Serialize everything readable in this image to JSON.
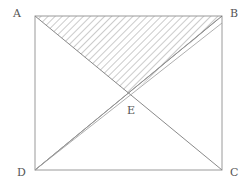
{
  "diagram": {
    "type": "geometry",
    "shape": "rectangle ABCD with diagonals",
    "points": {
      "A": {
        "label": "A",
        "x": 35,
        "y": 16
      },
      "B": {
        "label": "B",
        "x": 222,
        "y": 16
      },
      "C": {
        "label": "C",
        "x": 222,
        "y": 170
      },
      "D": {
        "label": "D",
        "x": 35,
        "y": 170
      },
      "E": {
        "label": "E",
        "x": 130,
        "y": 95
      }
    },
    "label_positions": {
      "A": {
        "left": 13,
        "top": 8
      },
      "B": {
        "left": 230,
        "top": 8
      },
      "C": {
        "left": 230,
        "top": 167
      },
      "D": {
        "left": 17,
        "top": 167
      },
      "E": {
        "left": 127,
        "top": 105
      }
    },
    "segments": [
      "AB",
      "BC",
      "CD",
      "DA",
      "AC",
      "DB"
    ],
    "extra_lines_from_D": [
      {
        "to_x": 218,
        "to_y": 19
      },
      {
        "to_x": 222,
        "to_y": 23
      }
    ],
    "shaded_region": "triangle ABE (hatched)",
    "colors": {
      "line": "#9a9a9a",
      "hatch": "#8c8c8c",
      "label": "#555555"
    }
  }
}
